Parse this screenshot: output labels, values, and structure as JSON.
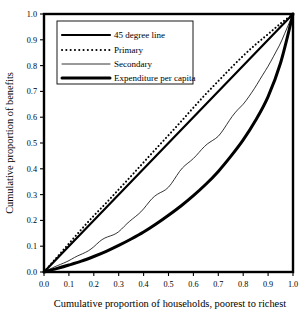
{
  "chart_data": {
    "type": "line",
    "title": "",
    "xlabel": "Cumulative proportion of households, poorest to richest",
    "ylabel": "Cumulative proportion of benefits",
    "xlim": [
      0.0,
      1.0
    ],
    "ylim": [
      0.0,
      1.0
    ],
    "grid": false,
    "legend_position": "upper-left",
    "xticks": [
      "0.0",
      "0.1",
      "0.2",
      "0.3",
      "0.4",
      "0.5",
      "0.6",
      "0.7",
      "0.8",
      "0.9",
      "1.0"
    ],
    "yticks": [
      "0.0",
      "0.1",
      "0.2",
      "0.3",
      "0.4",
      "0.5",
      "0.6",
      "0.7",
      "0.8",
      "0.9",
      "1.0"
    ],
    "x": [
      0.0,
      0.05,
      0.1,
      0.15,
      0.2,
      0.25,
      0.3,
      0.35,
      0.4,
      0.45,
      0.5,
      0.55,
      0.6,
      0.65,
      0.7,
      0.75,
      0.8,
      0.85,
      0.9,
      0.95,
      1.0
    ],
    "series": [
      {
        "name": "45 degree line",
        "style": "solid",
        "width": 2.2,
        "color": "#000000",
        "values": [
          0.0,
          0.05,
          0.1,
          0.15,
          0.2,
          0.25,
          0.3,
          0.35,
          0.4,
          0.45,
          0.5,
          0.55,
          0.6,
          0.65,
          0.7,
          0.75,
          0.8,
          0.85,
          0.9,
          0.95,
          1.0
        ]
      },
      {
        "name": "Primary",
        "style": "dotted",
        "width": 2.0,
        "color": "#000000",
        "values": [
          0.0,
          0.055,
          0.11,
          0.165,
          0.218,
          0.268,
          0.32,
          0.372,
          0.425,
          0.478,
          0.53,
          0.583,
          0.637,
          0.69,
          0.74,
          0.79,
          0.838,
          0.882,
          0.922,
          0.963,
          1.0
        ]
      },
      {
        "name": "Secondary",
        "style": "solid-thin-jagged",
        "width": 0.8,
        "color": "#000000",
        "values": [
          0.0,
          0.022,
          0.045,
          0.07,
          0.098,
          0.128,
          0.163,
          0.2,
          0.245,
          0.29,
          0.34,
          0.392,
          0.44,
          0.487,
          0.535,
          0.59,
          0.65,
          0.718,
          0.8,
          0.885,
          1.0
        ]
      },
      {
        "name": "Expenditure per capita",
        "style": "solid",
        "width": 3.0,
        "color": "#000000",
        "values": [
          0.0,
          0.013,
          0.027,
          0.042,
          0.06,
          0.08,
          0.103,
          0.128,
          0.155,
          0.186,
          0.22,
          0.256,
          0.296,
          0.34,
          0.39,
          0.448,
          0.512,
          0.588,
          0.68,
          0.81,
          1.0
        ]
      }
    ]
  },
  "legend": {
    "items": [
      {
        "label": "45 degree line"
      },
      {
        "label": "Primary"
      },
      {
        "label": "Secondary"
      },
      {
        "label": "Expenditure per capita"
      }
    ]
  },
  "axes": {
    "y_title": "Cumulative proportion of benefits",
    "x_title": "Cumulative proportion of households, poorest to richest"
  }
}
